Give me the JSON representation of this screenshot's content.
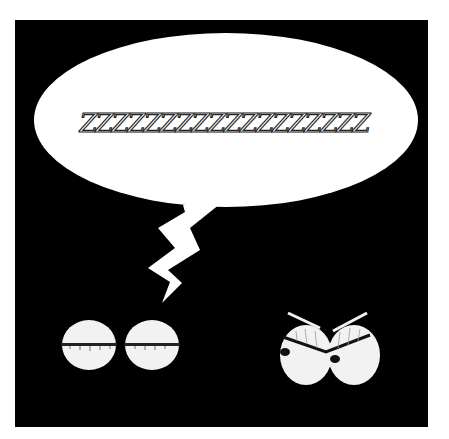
{
  "scene": {
    "background": "#ffffff",
    "panel_color": "#000000",
    "speech_bubble": {
      "text": "ZZZZZZZZZZZZZZZZZZ",
      "fill": "#ffffff",
      "text_color": "#222222"
    },
    "sleeping_eyes": {
      "label": "closed-eyes",
      "fill": "#f2f2f2"
    },
    "angry_eyes": {
      "label": "angry-eyes",
      "fill": "#f2f2f2"
    }
  }
}
